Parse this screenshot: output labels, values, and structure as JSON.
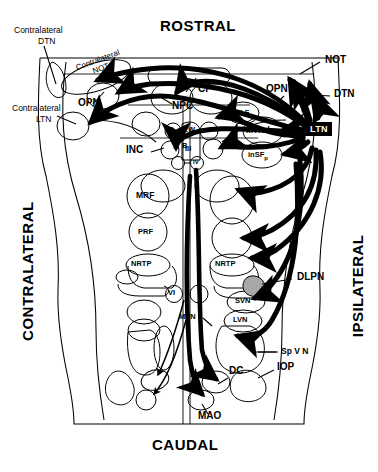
{
  "figure": {
    "kind": "neuroanatomical-connectivity-diagram",
    "orientation": {
      "top": "ROSTRAL",
      "bottom": "CAUDAL",
      "left": "CONTRALATERAL",
      "right": "IPSILATERAL"
    }
  },
  "source_node": {
    "label": "LTN",
    "style": "black-box-white-text"
  },
  "labels": {
    "contralateral_dtn": "Contralateral\nDTN",
    "contralateral_dtn_line1": "Contralateral",
    "contralateral_dtn_line2": "DTN",
    "contralateral_ltn_line1": "Contralateral",
    "contralateral_ltn_line2": "LTN",
    "contralateral_not_line1": "Contralateral",
    "contralateral_not_line2": "NOT",
    "opn_left": "OPN",
    "opn_right": "OPN",
    "not_right": "NOT",
    "dtn_right": "DTN",
    "cp": "CP",
    "npc": "NPC",
    "rmlf": "rMLF",
    "mtnd": "MTNd",
    "insfp": "inSF",
    "insfp_sub": "p",
    "inc": "INC",
    "d": "D",
    "b": "B",
    "ew": "EW",
    "iii": "III",
    "iv": "IV",
    "mrf": "MRF",
    "prf": "PRF",
    "nrtp_left": "NRTP",
    "nrtp_right": "NRTP",
    "dlpn": "DLPN",
    "vi": "VI",
    "svn": "SVN",
    "lvn": "LVN",
    "mvn": "MVN",
    "spvn": "Sp V N",
    "dc": "DC",
    "iop": "IOP",
    "mao": "MAO"
  },
  "nuclei": [
    {
      "id": "contralateral-not",
      "label": "Contralateral NOT",
      "side": "contralateral"
    },
    {
      "id": "opn-contra",
      "label": "OPN",
      "side": "contralateral"
    },
    {
      "id": "contralateral-ltn",
      "label": "Contralateral LTN",
      "side": "contralateral"
    },
    {
      "id": "inc",
      "label": "INC",
      "side": "contralateral"
    },
    {
      "id": "mrf",
      "label": "MRF",
      "side": "contralateral"
    },
    {
      "id": "prf",
      "label": "PRF",
      "side": "contralateral"
    },
    {
      "id": "nrtp-contra",
      "label": "NRTP",
      "side": "contralateral"
    },
    {
      "id": "cp",
      "label": "CP",
      "side": "midline"
    },
    {
      "id": "npc",
      "label": "NPC",
      "side": "contralateral"
    },
    {
      "id": "d",
      "label": "D",
      "side": "midline"
    },
    {
      "id": "b",
      "label": "B",
      "side": "midline"
    },
    {
      "id": "ew",
      "label": "EW",
      "side": "midline"
    },
    {
      "id": "iii",
      "label": "III",
      "side": "midline"
    },
    {
      "id": "iv",
      "label": "IV",
      "side": "midline"
    },
    {
      "id": "vi",
      "label": "VI",
      "side": "midline"
    },
    {
      "id": "rmlf",
      "label": "rMLF",
      "side": "ipsilateral"
    },
    {
      "id": "mtnd",
      "label": "MTNd",
      "side": "ipsilateral"
    },
    {
      "id": "insfp",
      "label": "inSFp",
      "side": "ipsilateral"
    },
    {
      "id": "not-ipsi",
      "label": "NOT",
      "side": "ipsilateral"
    },
    {
      "id": "opn-ipsi",
      "label": "OPN",
      "side": "ipsilateral"
    },
    {
      "id": "dtn-ipsi",
      "label": "DTN",
      "side": "ipsilateral"
    },
    {
      "id": "ltn",
      "label": "LTN",
      "side": "ipsilateral"
    },
    {
      "id": "nrtp-ipsi",
      "label": "NRTP",
      "side": "ipsilateral"
    },
    {
      "id": "dlpn",
      "label": "DLPN",
      "side": "ipsilateral",
      "fill": "gray"
    },
    {
      "id": "svn",
      "label": "SVN",
      "side": "ipsilateral"
    },
    {
      "id": "lvn",
      "label": "LVN",
      "side": "ipsilateral"
    },
    {
      "id": "mvn",
      "label": "MVN",
      "side": "ipsilateral"
    },
    {
      "id": "spvn",
      "label": "Sp V N",
      "side": "ipsilateral"
    },
    {
      "id": "dc",
      "label": "DC",
      "side": "midline"
    },
    {
      "id": "iop",
      "label": "IOP",
      "side": "ipsilateral"
    },
    {
      "id": "mao",
      "label": "MAO",
      "side": "midline"
    }
  ],
  "colors": {
    "outline": "#000000",
    "pathway": "#000000",
    "dlpn_fill": "#a8a8a8",
    "background": "#ffffff"
  }
}
